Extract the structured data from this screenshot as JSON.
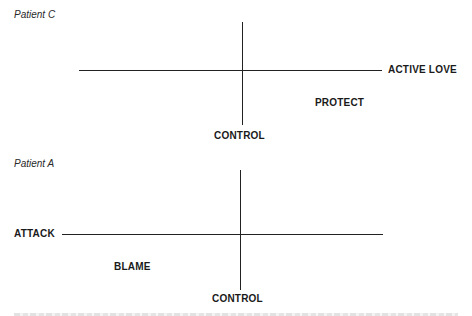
{
  "diagrams": [
    {
      "title": "Patient C",
      "labels": {
        "horizontal_right": "ACTIVE LOVE",
        "quadrant": "PROTECT",
        "vertical_bottom": "CONTROL"
      }
    },
    {
      "title": "Patient A",
      "labels": {
        "horizontal_left": "ATTACK",
        "quadrant": "BLAME",
        "vertical_bottom": "CONTROL"
      }
    }
  ],
  "colors": {
    "line": "#222222",
    "text": "#1a1a1a",
    "background": "#ffffff"
  }
}
